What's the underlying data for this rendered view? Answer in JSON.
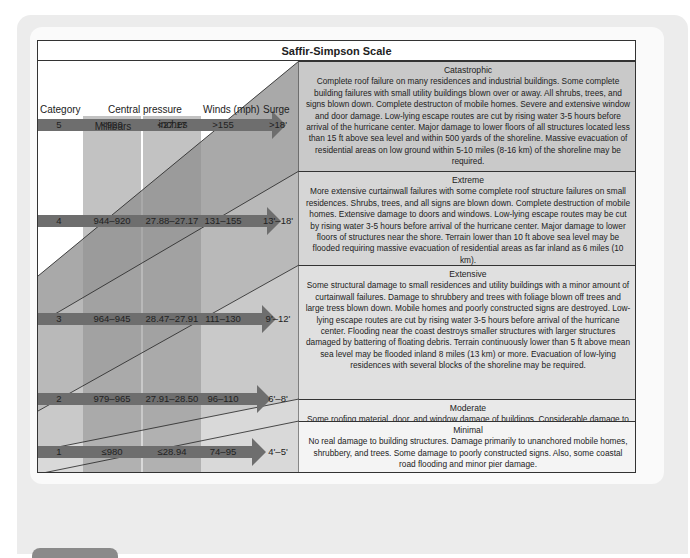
{
  "title": "Saffir-Simpson Scale",
  "headers": {
    "category": "Category",
    "central_pressure": "Central pressure",
    "millibars": "Millibars",
    "inches": "inches",
    "winds": "Winds (mph)",
    "surge": "Surge"
  },
  "rows": [
    {
      "category": "5",
      "millibars": "<920",
      "inches": "<27.17",
      "winds": ">155",
      "surge": ">18'",
      "level": "Catastrophic",
      "description": "Complete roof failure on many residences and industrial buildings. Some complete building failures with small utility buildings blown over or away. All shrubs, trees, and signs blown down. Complete destructon of mobile homes. Severe and extensive window and door damage. Low-lying escape routes are cut by rising water 3-5 hours before arrival of the hurricane center. Major damage to lower floors of all structures located less than 15 ft above sea level and within 500 yards of the shoreline. Massive evacuation of residential areas on low ground within 5-10 miles (8-16 km) of the shoreline may be required."
    },
    {
      "category": "4",
      "millibars": "944–920",
      "inches": "27.88–27.17",
      "winds": "131–155",
      "surge": "13'–18'",
      "level": "Extreme",
      "description": "More extensive curtainwall failures with some complete roof structure failures on small residences. Shrubs, trees, and all signs are blown down. Complete destruction of mobile homes. Extensive damage to doors and windows. Low-lying escape routes may be cut by rising water 3-5 hours before arrival of the hurricane center. Major damage to lower floors of structures near the shore. Terrain lower than 10 ft above sea level may be flooded requiring massive evacuation of residential areas as far inland as 6 miles (10 km)."
    },
    {
      "category": "3",
      "millibars": "964–945",
      "inches": "28.47–27.91",
      "winds": "111–130",
      "surge": "9'–12'",
      "level": "Extensive",
      "description": "Some structural damage to small residences and utility buildings with a minor amount of curtainwall failures. Damage to shrubbery and trees with foliage blown off trees and large tress blown down. Mobile homes and poorly constructed signs are destroyed. Low-lying escape routes are cut by rising water 3-5 hours before arrival of the hurricane center. Flooding near the coast destroys smaller structures with larger structures damaged by battering of floating debris. Terrain continuously lower than 5 ft above mean sea level may be flooded inland 8 miles (13 km) or more. Evacuation of low-lying residences with several blocks of the shoreline may be required."
    },
    {
      "category": "2",
      "millibars": "979–965",
      "inches": "27.91–28.50",
      "winds": "96–110",
      "surge": "6'–8'",
      "level": "Moderate",
      "description": "Some roofing material, door, and window damage of buildings. Considerable damage to shrubbery and trees with some trees blown down. Considerable damage to mobile homes, poorly constructed signs, and piers. Coastal and low-lying escape routes flood 2-4 hours before arrival of the hurricane center. Small craft in unprotected anchorages break moorings."
    },
    {
      "category": "1",
      "millibars": "≤980",
      "inches": "≤28.94",
      "winds": "74–95",
      "surge": "4'–5'",
      "level": "Minimal",
      "description": "No real damage to building structures. Damage primarily to unanchored mobile homes, shrubbery, and trees. Some damage to poorly constructed signs. Also, some coastal road flooding and minor pier damage."
    }
  ],
  "colors": {
    "arrow": "#6e6e6e",
    "pressure_column": "#8f8f8f",
    "band_dark": "#a8a8a8",
    "band_light": "#e4e4e4"
  }
}
